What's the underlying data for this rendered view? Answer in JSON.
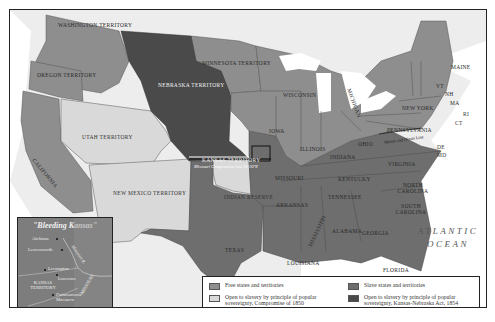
{
  "map": {
    "inset": {
      "title": "\"Bleeding Kansas\"",
      "towns": [
        "Atchison",
        "Leavenworth",
        "Lecompton",
        "Lawrence",
        "Pottawatomie Massacre"
      ],
      "labels": {
        "river": "Missouri R.",
        "territory": "KANSAS TERRITORY",
        "state": "MISSOURI"
      }
    },
    "regions": {
      "washington": "WASHINGTON TERRITORY",
      "oregon": "OREGON TERRITORY",
      "california": "CALIFORNIA",
      "utah": "UTAH TERRITORY",
      "new_mexico": "NEW MEXICO TERRITORY",
      "nebraska": "NEBRASKA TERRITORY",
      "kansas": "KANSAS TERRITORY",
      "minnesota": "MINNESOTA TERRITORY",
      "indian_reserve": "INDIAN RESERVE",
      "texas": "TEXAS",
      "wisconsin": "WISCONSIN",
      "iowa": "IOWA",
      "michigan": "MICHIGAN",
      "illinois": "ILLINOIS",
      "indiana": "INDIANA",
      "ohio": "OHIO",
      "missouri": "MISSOURI",
      "arkansas": "ARKANSAS",
      "louisiana": "LOUISIANA",
      "mississippi": "MISSISSIPPI",
      "alabama": "ALABAMA",
      "georgia": "GEORGIA",
      "florida": "FLORIDA",
      "tennessee": "TENNESSEE",
      "kentucky": "KENTUCKY",
      "virginia": "VIRGINIA",
      "north_carolina": "NORTH CAROLINA",
      "south_carolina": "SOUTH CAROLINA",
      "pennsylvania": "PENNSYLVANIA",
      "new_york": "NEW YORK",
      "maine": "MAINE",
      "vt": "VT",
      "nh": "NH",
      "ma": "MA",
      "ri": "RI",
      "ct": "CT",
      "de": "DE",
      "md": "MD"
    },
    "lines": {
      "missouri_compromise": "Missouri Compromise line 36°30'N",
      "mason_dixon": "Mason and Dixon Line"
    },
    "ocean": "ATLANTIC OCEAN",
    "colors": {
      "free": "#8e8e8e",
      "slave": "#6e6e6e",
      "open_1850": "#d9d9d9",
      "open_1854": "#4a4a4a",
      "water": "#ffffff",
      "canada": "#ededed"
    }
  },
  "legend": {
    "items": [
      {
        "label": "Free states and territories",
        "color": "#8e8e8e"
      },
      {
        "label": "Open to slavery by principle of popular sovereignty, Compromise of 1850",
        "color": "#d9d9d9"
      },
      {
        "label": "Slave states and territories",
        "color": "#6e6e6e"
      },
      {
        "label": "Open to slavery by principle of popular sovereignty, Kansas-Nebraska Act, 1854",
        "color": "#4a4a4a"
      }
    ]
  }
}
